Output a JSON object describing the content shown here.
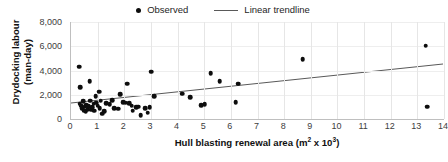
{
  "chart_data": {
    "type": "scatter",
    "title": "",
    "xlabel": "Hull blasting renewal area (m² x 10³)",
    "xlabel_main": "Hull blasting renewal area (m",
    "xlabel_sup1": "2",
    "xlabel_mid": " x 10",
    "xlabel_sup2": "3",
    "xlabel_end": ")",
    "ylabel": "Drydocking labour (man-day)",
    "ylabel_line1": "Drydocking labour",
    "ylabel_line2": "(man-day)",
    "xlim": [
      0,
      14
    ],
    "ylim": [
      0,
      8000
    ],
    "xticks": [
      0,
      1,
      2,
      3,
      4,
      5,
      6,
      7,
      8,
      9,
      10,
      11,
      12,
      13,
      14
    ],
    "xtick_labels": [
      "0",
      "1",
      "2",
      "3",
      "4",
      "5",
      "6",
      "7",
      "8",
      "9",
      "10",
      "11",
      "12",
      "13",
      "14"
    ],
    "yticks": [
      0,
      2000,
      4000,
      6000,
      8000
    ],
    "ytick_labels": [
      "0",
      "2,000",
      "4,000",
      "6,000",
      "8,000"
    ],
    "grid": {
      "vertical": true,
      "horizontal": true
    },
    "legend": {
      "position": "top-center",
      "entries": [
        {
          "label": "Observed",
          "marker": "dot",
          "color": "#0d0d0d"
        },
        {
          "label": "Linear trendline",
          "marker": "line",
          "color": "#595959"
        }
      ]
    },
    "series": [
      {
        "name": "Observed",
        "marker": "dot",
        "color": "#0d0d0d",
        "points": [
          [
            0.3,
            4300
          ],
          [
            0.35,
            2600
          ],
          [
            0.32,
            1250
          ],
          [
            0.38,
            1100
          ],
          [
            0.42,
            900
          ],
          [
            0.45,
            1450
          ],
          [
            0.48,
            700
          ],
          [
            0.52,
            1000
          ],
          [
            0.55,
            620
          ],
          [
            0.58,
            1150
          ],
          [
            0.62,
            820
          ],
          [
            0.66,
            1050
          ],
          [
            0.7,
            3100
          ],
          [
            0.72,
            1500
          ],
          [
            0.75,
            780
          ],
          [
            0.8,
            950
          ],
          [
            0.85,
            1250
          ],
          [
            0.88,
            700
          ],
          [
            0.92,
            1900
          ],
          [
            0.95,
            1350
          ],
          [
            1.0,
            1100
          ],
          [
            1.05,
            2250
          ],
          [
            1.08,
            880
          ],
          [
            1.12,
            1500
          ],
          [
            1.18,
            450
          ],
          [
            1.25,
            620
          ],
          [
            1.32,
            1300
          ],
          [
            1.45,
            1200
          ],
          [
            1.55,
            1550
          ],
          [
            1.62,
            900
          ],
          [
            1.78,
            850
          ],
          [
            1.85,
            2050
          ],
          [
            1.95,
            1400
          ],
          [
            2.05,
            1350
          ],
          [
            2.1,
            2900
          ],
          [
            2.18,
            1300
          ],
          [
            2.28,
            1100
          ],
          [
            2.32,
            700
          ],
          [
            2.45,
            950
          ],
          [
            2.52,
            1000
          ],
          [
            2.62,
            300
          ],
          [
            2.78,
            900
          ],
          [
            2.88,
            520
          ],
          [
            2.95,
            950
          ],
          [
            3.0,
            3900
          ],
          [
            3.12,
            1900
          ],
          [
            4.18,
            2100
          ],
          [
            4.48,
            1780
          ],
          [
            4.88,
            1150
          ],
          [
            5.02,
            1200
          ],
          [
            5.25,
            3800
          ],
          [
            5.58,
            3100
          ],
          [
            6.18,
            1400
          ],
          [
            6.28,
            2900
          ],
          [
            8.7,
            4950
          ],
          [
            13.32,
            6050
          ],
          [
            13.38,
            1000
          ]
        ]
      }
    ],
    "trendline": {
      "name": "Linear trendline",
      "color": "#595959",
      "x_start": 0.0,
      "y_start": 1250,
      "x_end": 14.0,
      "y_end": 4500
    }
  }
}
